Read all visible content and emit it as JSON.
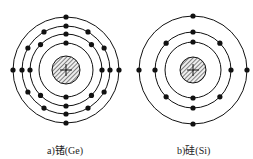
{
  "diagrams": [
    {
      "id": "ge",
      "caption": "a)锗(Ge)",
      "nucleus_symbol": "+",
      "shells": [
        2,
        8,
        18,
        4
      ]
    },
    {
      "id": "si",
      "caption": "b)硅(Si)",
      "nucleus_symbol": "+",
      "shells": [
        2,
        8,
        4
      ]
    }
  ]
}
